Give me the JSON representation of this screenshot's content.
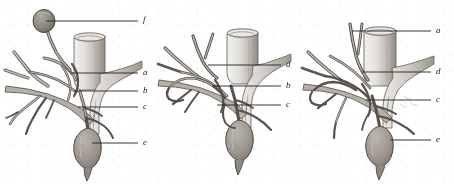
{
  "figure": {
    "kind": "engraved-anatomical-plate",
    "background_color": "#ffffff",
    "ink_color": "#3a3733",
    "label_color": "#1d1b19",
    "panel_count": 3,
    "width": 454,
    "height": 185
  },
  "panels": [
    {
      "id": "panel-1",
      "name": "left-variant",
      "labels": [
        {
          "key": "f",
          "text": "f",
          "x": 143,
          "y": 20,
          "leader_from_x": 46,
          "leader_from_y": 21,
          "leader_to_x": 138,
          "leader_to_y": 21
        },
        {
          "key": "a",
          "text": "a",
          "x": 143,
          "y": 70,
          "leader_from_x": 70,
          "leader_from_y": 73,
          "leader_to_x": 138,
          "leader_to_y": 73
        },
        {
          "key": "b",
          "text": "b",
          "x": 143,
          "y": 88,
          "leader_from_x": 74,
          "leader_from_y": 91,
          "leader_to_x": 138,
          "leader_to_y": 91
        },
        {
          "key": "c",
          "text": "c",
          "x": 143,
          "y": 105,
          "leader_from_x": 78,
          "leader_from_y": 107,
          "leader_to_x": 138,
          "leader_to_y": 107
        },
        {
          "key": "e",
          "text": "e",
          "x": 143,
          "y": 140,
          "leader_from_x": 92,
          "leader_from_y": 143,
          "leader_to_x": 138,
          "leader_to_y": 143
        }
      ]
    },
    {
      "id": "panel-2",
      "name": "middle-variant",
      "labels": [
        {
          "key": "d",
          "text": "d",
          "x": 131,
          "y": 62,
          "leader_from_x": 53,
          "leader_from_y": 65,
          "leader_to_x": 126,
          "leader_to_y": 65
        },
        {
          "key": "b",
          "text": "b",
          "x": 131,
          "y": 83,
          "leader_from_x": 57,
          "leader_from_y": 86,
          "leader_to_x": 126,
          "leader_to_y": 86
        },
        {
          "key": "c",
          "text": "c",
          "x": 131,
          "y": 102,
          "leader_from_x": 62,
          "leader_from_y": 105,
          "leader_to_x": 126,
          "leader_to_y": 105
        }
      ]
    },
    {
      "id": "panel-3",
      "name": "right-variant",
      "labels": [
        {
          "key": "a",
          "text": "a",
          "x": 136,
          "y": 28,
          "leader_from_x": 52,
          "leader_from_y": 31,
          "leader_to_x": 131,
          "leader_to_y": 31
        },
        {
          "key": "d",
          "text": "d",
          "x": 136,
          "y": 69,
          "leader_from_x": 62,
          "leader_from_y": 72,
          "leader_to_x": 131,
          "leader_to_y": 72
        },
        {
          "key": "c",
          "text": "c",
          "x": 136,
          "y": 97,
          "leader_from_x": 66,
          "leader_from_y": 100,
          "leader_to_x": 131,
          "leader_to_y": 100
        },
        {
          "key": "e",
          "text": "e",
          "x": 136,
          "y": 137,
          "leader_from_x": 90,
          "leader_from_y": 140,
          "leader_to_x": 131,
          "leader_to_y": 140
        }
      ]
    }
  ]
}
